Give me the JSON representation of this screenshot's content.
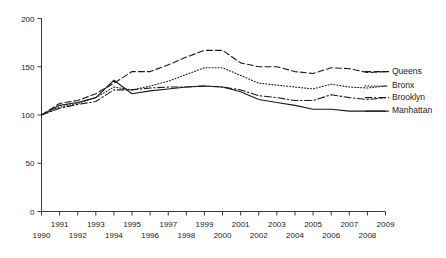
{
  "chart_data": {
    "type": "line",
    "title": "",
    "subtitle": "",
    "xlabel": "",
    "ylabel": "",
    "xlim": [
      1990,
      2009
    ],
    "ylim": [
      0,
      200
    ],
    "grid": false,
    "legend_position": "right",
    "x": [
      1990,
      1991,
      1992,
      1993,
      1994,
      1995,
      1996,
      1997,
      1998,
      1999,
      2000,
      2001,
      2002,
      2003,
      2004,
      2005,
      2006,
      2007,
      2008,
      2009
    ],
    "xtick_labels_upper": [
      "1991",
      "1993",
      "1995",
      "1997",
      "1999",
      "2001",
      "2003",
      "2005",
      "2007",
      "2009"
    ],
    "xtick_labels_lower": [
      "1990",
      "1992",
      "1994",
      "1996",
      "1998",
      "2000",
      "2002",
      "2004",
      "2006",
      "2008"
    ],
    "ytick_labels": [
      "0",
      "50",
      "100",
      "150",
      "200"
    ],
    "ytick_values": [
      0,
      50,
      100,
      150,
      200
    ],
    "series": [
      {
        "name": "Queens",
        "line_style": "dashed",
        "color": "#1a1a1a",
        "values": [
          100,
          112,
          115,
          122,
          133,
          145,
          145,
          152,
          160,
          167,
          167,
          154,
          150,
          150,
          145,
          143,
          149,
          148,
          144,
          145
        ]
      },
      {
        "name": "Bronx",
        "line_style": "dotted",
        "color": "#1a1a1a",
        "values": [
          100,
          108,
          112,
          118,
          129,
          126,
          130,
          135,
          142,
          149,
          149,
          141,
          133,
          131,
          129,
          127,
          132,
          129,
          128,
          130
        ]
      },
      {
        "name": "Brooklyn",
        "line_style": "dashdot",
        "color": "#1a1a1a",
        "values": [
          100,
          107,
          111,
          114,
          126,
          126,
          128,
          129,
          129,
          130,
          129,
          126,
          120,
          118,
          115,
          115,
          121,
          118,
          116,
          118
        ]
      },
      {
        "name": "Manhattan",
        "line_style": "solid",
        "color": "#1a1a1a",
        "values": [
          100,
          110,
          113,
          118,
          136,
          122,
          125,
          127,
          129,
          130,
          129,
          124,
          116,
          113,
          110,
          106,
          106,
          104,
          104,
          104
        ]
      }
    ]
  },
  "legend": {
    "items": [
      {
        "label": "Queens"
      },
      {
        "label": "Bronx"
      },
      {
        "label": "Brooklyn"
      },
      {
        "label": "Manhattan"
      }
    ]
  }
}
